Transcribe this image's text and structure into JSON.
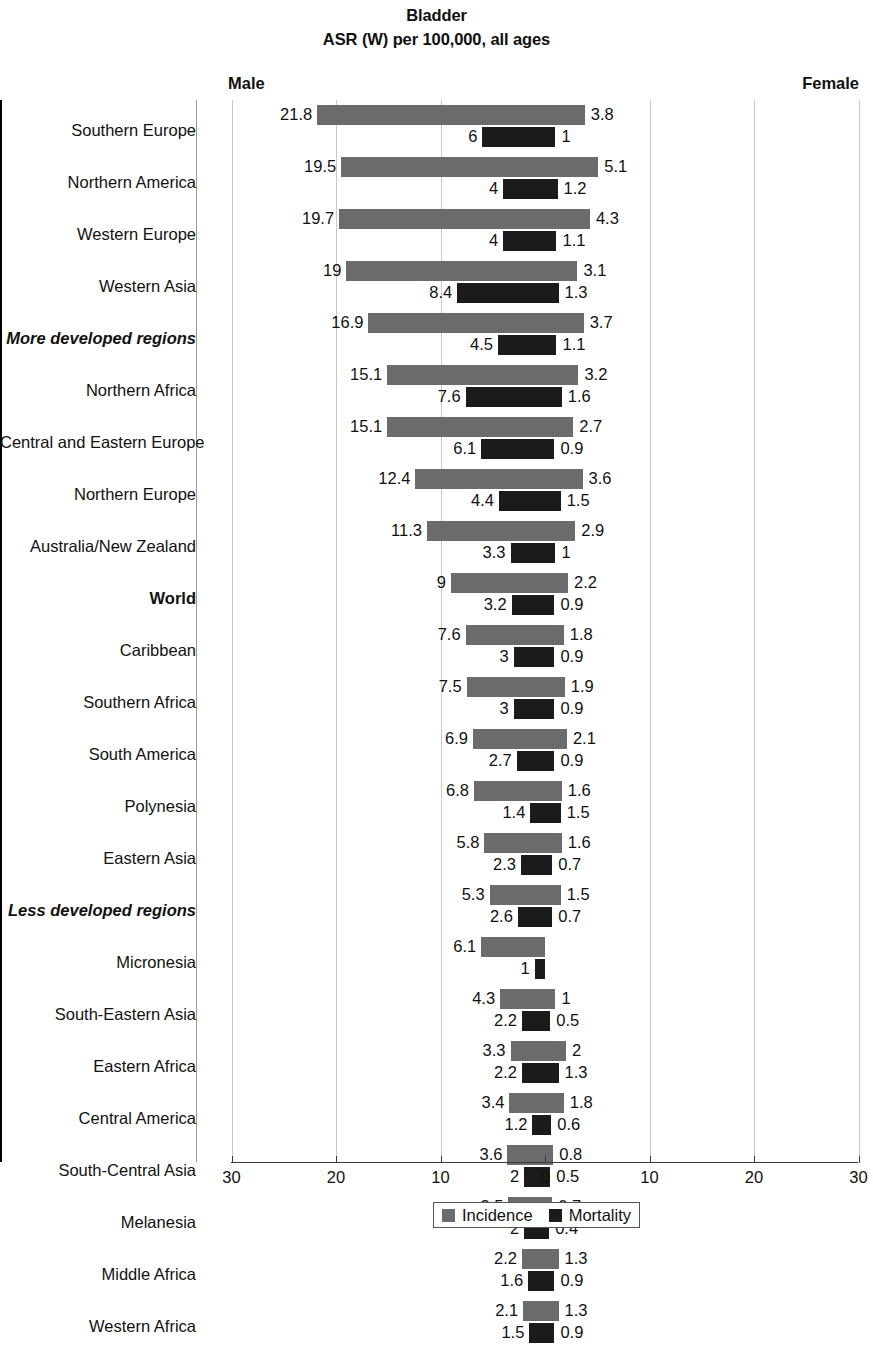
{
  "header": {
    "title": "Bladder",
    "subtitle": "ASR (W) per 100,000, all ages",
    "male_label": "Male",
    "female_label": "Female"
  },
  "legend": {
    "incidence_label": "Incidence",
    "mortality_label": "Mortality",
    "incidence_color": "#6b6b6b",
    "mortality_color": "#1b1b1b"
  },
  "axis": {
    "ticks": [
      "30",
      "20",
      "10",
      "0",
      "10",
      "20",
      "30"
    ],
    "max": 30
  },
  "chart_data": {
    "type": "bar",
    "orientation": "horizontal-diverging",
    "title": "Bladder",
    "subtitle": "ASR (W) per 100,000, all ages",
    "xlabel": "ASR (W) per 100,000, all ages",
    "ylabel": "",
    "xlim": [
      -30,
      30
    ],
    "grid": true,
    "legend_position": "bottom",
    "left_side": "Male",
    "right_side": "Female",
    "series": [
      {
        "name": "Incidence",
        "color": "#6b6b6b"
      },
      {
        "name": "Mortality",
        "color": "#1b1b1b"
      }
    ],
    "categories": [
      "Southern Europe",
      "Northern America",
      "Western Europe",
      "Western Asia",
      "More developed regions",
      "Northern Africa",
      "Central and Eastern Europe",
      "Northern Europe",
      "Australia/New Zealand",
      "World",
      "Caribbean",
      "Southern Africa",
      "South America",
      "Polynesia",
      "Eastern Asia",
      "Less developed regions",
      "Micronesia",
      "South-Eastern Asia",
      "Eastern Africa",
      "Central America",
      "South-Central Asia",
      "Melanesia",
      "Middle Africa",
      "Western Africa"
    ],
    "rows": [
      {
        "label": "Southern Europe",
        "emphasis": "none",
        "male_incidence": 21.8,
        "female_incidence": 3.8,
        "male_mortality": 6,
        "female_mortality": 1
      },
      {
        "label": "Northern America",
        "emphasis": "none",
        "male_incidence": 19.5,
        "female_incidence": 5.1,
        "male_mortality": 4,
        "female_mortality": 1.2
      },
      {
        "label": "Western Europe",
        "emphasis": "none",
        "male_incidence": 19.7,
        "female_incidence": 4.3,
        "male_mortality": 4,
        "female_mortality": 1.1
      },
      {
        "label": "Western Asia",
        "emphasis": "none",
        "male_incidence": 19,
        "female_incidence": 3.1,
        "male_mortality": 8.4,
        "female_mortality": 1.3
      },
      {
        "label": "More developed regions",
        "emphasis": "bold-italic",
        "male_incidence": 16.9,
        "female_incidence": 3.7,
        "male_mortality": 4.5,
        "female_mortality": 1.1
      },
      {
        "label": "Northern Africa",
        "emphasis": "none",
        "male_incidence": 15.1,
        "female_incidence": 3.2,
        "male_mortality": 7.6,
        "female_mortality": 1.6
      },
      {
        "label": "Central and Eastern Europe",
        "emphasis": "none",
        "male_incidence": 15.1,
        "female_incidence": 2.7,
        "male_mortality": 6.1,
        "female_mortality": 0.9
      },
      {
        "label": "Northern Europe",
        "emphasis": "none",
        "male_incidence": 12.4,
        "female_incidence": 3.6,
        "male_mortality": 4.4,
        "female_mortality": 1.5
      },
      {
        "label": "Australia/New Zealand",
        "emphasis": "none",
        "male_incidence": 11.3,
        "female_incidence": 2.9,
        "male_mortality": 3.3,
        "female_mortality": 1
      },
      {
        "label": "World",
        "emphasis": "bold",
        "male_incidence": 9,
        "female_incidence": 2.2,
        "male_mortality": 3.2,
        "female_mortality": 0.9
      },
      {
        "label": "Caribbean",
        "emphasis": "none",
        "male_incidence": 7.6,
        "female_incidence": 1.8,
        "male_mortality": 3,
        "female_mortality": 0.9
      },
      {
        "label": "Southern Africa",
        "emphasis": "none",
        "male_incidence": 7.5,
        "female_incidence": 1.9,
        "male_mortality": 3,
        "female_mortality": 0.9
      },
      {
        "label": "South America",
        "emphasis": "none",
        "male_incidence": 6.9,
        "female_incidence": 2.1,
        "male_mortality": 2.7,
        "female_mortality": 0.9
      },
      {
        "label": "Polynesia",
        "emphasis": "none",
        "male_incidence": 6.8,
        "female_incidence": 1.6,
        "male_mortality": 1.4,
        "female_mortality": 1.5
      },
      {
        "label": "Eastern Asia",
        "emphasis": "none",
        "male_incidence": 5.8,
        "female_incidence": 1.6,
        "male_mortality": 2.3,
        "female_mortality": 0.7
      },
      {
        "label": "Less developed regions",
        "emphasis": "bold-italic",
        "male_incidence": 5.3,
        "female_incidence": 1.5,
        "male_mortality": 2.6,
        "female_mortality": 0.7
      },
      {
        "label": "Micronesia",
        "emphasis": "none",
        "male_incidence": 6.1,
        "female_incidence": null,
        "male_mortality": 1,
        "female_mortality": null
      },
      {
        "label": "South-Eastern Asia",
        "emphasis": "none",
        "male_incidence": 4.3,
        "female_incidence": 1,
        "male_mortality": 2.2,
        "female_mortality": 0.5
      },
      {
        "label": "Eastern Africa",
        "emphasis": "none",
        "male_incidence": 3.3,
        "female_incidence": 2,
        "male_mortality": 2.2,
        "female_mortality": 1.3
      },
      {
        "label": "Central America",
        "emphasis": "none",
        "male_incidence": 3.4,
        "female_incidence": 1.8,
        "male_mortality": 1.2,
        "female_mortality": 0.6
      },
      {
        "label": "South-Central Asia",
        "emphasis": "none",
        "male_incidence": 3.6,
        "female_incidence": 0.8,
        "male_mortality": 2,
        "female_mortality": 0.5
      },
      {
        "label": "Melanesia",
        "emphasis": "none",
        "male_incidence": 3.5,
        "female_incidence": 0.7,
        "male_mortality": 2,
        "female_mortality": 0.4
      },
      {
        "label": "Middle Africa",
        "emphasis": "none",
        "male_incidence": 2.2,
        "female_incidence": 1.3,
        "male_mortality": 1.6,
        "female_mortality": 0.9
      },
      {
        "label": "Western Africa",
        "emphasis": "none",
        "male_incidence": 2.1,
        "female_incidence": 1.3,
        "male_mortality": 1.5,
        "female_mortality": 0.9
      }
    ]
  }
}
